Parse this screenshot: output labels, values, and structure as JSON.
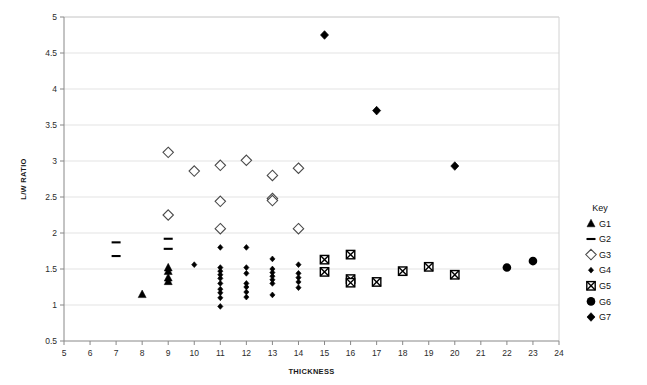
{
  "chart_data": {
    "type": "scatter",
    "title": "",
    "xlabel": "THICKNESS",
    "ylabel": "L/W RATIO",
    "xlim": [
      5,
      24
    ],
    "ylim": [
      0.5,
      5
    ],
    "xticks": [
      5,
      6,
      7,
      8,
      9,
      10,
      11,
      12,
      13,
      14,
      15,
      16,
      17,
      18,
      19,
      20,
      21,
      22,
      23,
      24
    ],
    "yticks": [
      0.5,
      1,
      1.5,
      2,
      2.5,
      3,
      3.5,
      4,
      4.5,
      5
    ],
    "xtick_labels": [
      "5",
      "6",
      "7",
      "8",
      "9",
      "10",
      "11",
      "12",
      "13",
      "14",
      "15",
      "16",
      "17",
      "18",
      "19",
      "20",
      "21",
      "22",
      "23",
      "24"
    ],
    "ytick_labels": [
      "0.5",
      "1",
      "1.5",
      "2",
      "2.5",
      "3",
      "3.5",
      "4",
      "4.5",
      "5"
    ],
    "grid": "horizontal",
    "grid_color": "#e3e3e3",
    "axis_color": "#888888",
    "legend_position": "right",
    "legend_title": "Key",
    "series": [
      {
        "name": "G1",
        "marker": "triangle-up",
        "fill": "#000000",
        "points": [
          [
            8,
            1.15
          ],
          [
            9,
            1.52
          ],
          [
            9,
            1.47
          ],
          [
            9,
            1.38
          ],
          [
            9,
            1.33
          ]
        ]
      },
      {
        "name": "G2",
        "marker": "dash",
        "fill": "#000000",
        "points": [
          [
            7,
            1.87
          ],
          [
            7,
            1.68
          ],
          [
            9,
            1.92
          ],
          [
            9,
            1.78
          ]
        ]
      },
      {
        "name": "G3",
        "marker": "diamond-open",
        "fill": "#ffffff",
        "points": [
          [
            9,
            3.12
          ],
          [
            9,
            2.25
          ],
          [
            10,
            2.86
          ],
          [
            11,
            2.94
          ],
          [
            11,
            2.44
          ],
          [
            11,
            2.06
          ],
          [
            12,
            3.01
          ],
          [
            13,
            2.8
          ],
          [
            13,
            2.48
          ],
          [
            13,
            2.45
          ],
          [
            14,
            2.9
          ],
          [
            14,
            2.06
          ]
        ]
      },
      {
        "name": "G4",
        "marker": "diamond-filled-small",
        "fill": "#000000",
        "points": [
          [
            11,
            1.8
          ],
          [
            11,
            1.52
          ],
          [
            11,
            1.47
          ],
          [
            11,
            1.42
          ],
          [
            11,
            1.37
          ],
          [
            11,
            1.3
          ],
          [
            11,
            1.22
          ],
          [
            11,
            1.17
          ],
          [
            11,
            1.1
          ],
          [
            11,
            0.98
          ],
          [
            12,
            1.8
          ],
          [
            12,
            1.52
          ],
          [
            12,
            1.44
          ],
          [
            12,
            1.3
          ],
          [
            12,
            1.25
          ],
          [
            12,
            1.18
          ],
          [
            12,
            1.11
          ],
          [
            13,
            1.64
          ],
          [
            13,
            1.5
          ],
          [
            13,
            1.45
          ],
          [
            13,
            1.4
          ],
          [
            13,
            1.35
          ],
          [
            13,
            1.3
          ],
          [
            13,
            1.14
          ],
          [
            14,
            1.56
          ],
          [
            14,
            1.44
          ],
          [
            14,
            1.38
          ],
          [
            14,
            1.32
          ],
          [
            14,
            1.24
          ],
          [
            10,
            1.56
          ]
        ]
      },
      {
        "name": "G5",
        "marker": "square-x",
        "fill": "#ffffff",
        "points": [
          [
            15,
            1.63
          ],
          [
            15,
            1.46
          ],
          [
            16,
            1.7
          ],
          [
            16,
            1.36
          ],
          [
            16,
            1.31
          ],
          [
            17,
            1.32
          ],
          [
            18,
            1.47
          ],
          [
            19,
            1.53
          ],
          [
            20,
            1.42
          ]
        ]
      },
      {
        "name": "G6",
        "marker": "circle-filled",
        "fill": "#000000",
        "points": [
          [
            22,
            1.52
          ],
          [
            23,
            1.61
          ]
        ]
      },
      {
        "name": "G7",
        "marker": "diamond-filled",
        "fill": "#000000",
        "points": [
          [
            15,
            4.75
          ],
          [
            17,
            3.7
          ],
          [
            20,
            2.93
          ]
        ]
      }
    ]
  },
  "legend": {
    "title": "Key",
    "items": [
      {
        "label": "G1",
        "marker": "triangle-up"
      },
      {
        "label": "G2",
        "marker": "dash"
      },
      {
        "label": "G3",
        "marker": "diamond-open"
      },
      {
        "label": "G4",
        "marker": "diamond-filled-small"
      },
      {
        "label": "G5",
        "marker": "square-x"
      },
      {
        "label": "G6",
        "marker": "circle-filled"
      },
      {
        "label": "G7",
        "marker": "diamond-filled"
      }
    ]
  }
}
